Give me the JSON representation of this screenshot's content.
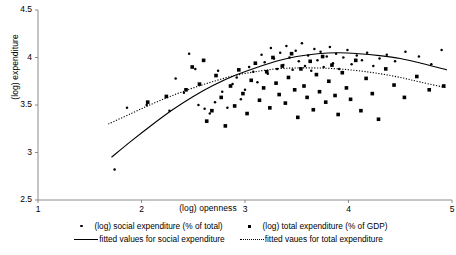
{
  "chart_data": {
    "type": "scatter",
    "title": "",
    "xlabel": "(log) openness",
    "ylabel": "(log) expenditure",
    "xlim": [
      1,
      5
    ],
    "ylim": [
      2.5,
      4.5
    ],
    "xticks": [
      1,
      2,
      3,
      4,
      5
    ],
    "yticks": [
      2.5,
      3.0,
      3.5,
      4.0,
      4.5
    ],
    "xtick_labels": [
      "1",
      "2",
      "3",
      "4",
      "5"
    ],
    "ytick_labels": [
      "2.5",
      "3",
      "3.5",
      "4",
      "4.5"
    ],
    "grid": false,
    "legend_position": "below",
    "series": [
      {
        "name": "(log) social expenditure (% of total)",
        "marker": "dot",
        "points": [
          [
            1.74,
            2.82
          ],
          [
            1.86,
            3.47
          ],
          [
            2.05,
            3.5
          ],
          [
            2.27,
            3.44
          ],
          [
            2.33,
            3.78
          ],
          [
            2.41,
            3.63
          ],
          [
            2.46,
            4.04
          ],
          [
            2.52,
            3.88
          ],
          [
            2.55,
            3.5
          ],
          [
            2.61,
            3.46
          ],
          [
            2.66,
            3.41
          ],
          [
            2.71,
            3.53
          ],
          [
            2.74,
            3.86
          ],
          [
            2.78,
            3.64
          ],
          [
            2.83,
            3.47
          ],
          [
            2.88,
            3.72
          ],
          [
            2.92,
            3.79
          ],
          [
            2.96,
            3.56
          ],
          [
            3.0,
            3.66
          ],
          [
            3.04,
            3.9
          ],
          [
            3.08,
            3.85
          ],
          [
            3.12,
            3.74
          ],
          [
            3.16,
            4.03
          ],
          [
            3.19,
            3.95
          ],
          [
            3.22,
            3.83
          ],
          [
            3.25,
            4.1
          ],
          [
            3.28,
            3.99
          ],
          [
            3.31,
            3.88
          ],
          [
            3.34,
            4.05
          ],
          [
            3.37,
            3.92
          ],
          [
            3.4,
            4.12
          ],
          [
            3.43,
            4.0
          ],
          [
            3.46,
            3.87
          ],
          [
            3.49,
            4.07
          ],
          [
            3.52,
            3.96
          ],
          [
            3.55,
            4.15
          ],
          [
            3.58,
            3.91
          ],
          [
            3.61,
            4.02
          ],
          [
            3.64,
            3.86
          ],
          [
            3.67,
            4.09
          ],
          [
            3.7,
            3.97
          ],
          [
            3.73,
            4.06
          ],
          [
            3.76,
            3.9
          ],
          [
            3.79,
            4.01
          ],
          [
            3.82,
            4.11
          ],
          [
            3.85,
            3.94
          ],
          [
            3.88,
            4.04
          ],
          [
            3.91,
            3.88
          ],
          [
            3.95,
            4.0
          ],
          [
            3.99,
            4.08
          ],
          [
            4.03,
            3.93
          ],
          [
            4.08,
            4.02
          ],
          [
            4.13,
            3.97
          ],
          [
            4.18,
            4.05
          ],
          [
            4.24,
            3.91
          ],
          [
            4.3,
            3.99
          ],
          [
            4.37,
            4.03
          ],
          [
            4.45,
            3.96
          ],
          [
            4.55,
            4.06
          ],
          [
            4.68,
            4.01
          ],
          [
            4.8,
            3.93
          ],
          [
            4.9,
            4.08
          ]
        ]
      },
      {
        "name": "(log) total expenditure (% of GDP)",
        "marker": "square",
        "points": [
          [
            2.06,
            3.53
          ],
          [
            2.24,
            3.59
          ],
          [
            2.43,
            3.66
          ],
          [
            2.49,
            3.9
          ],
          [
            2.56,
            3.72
          ],
          [
            2.6,
            3.97
          ],
          [
            2.63,
            3.33
          ],
          [
            2.68,
            3.44
          ],
          [
            2.72,
            3.81
          ],
          [
            2.77,
            3.58
          ],
          [
            2.81,
            3.28
          ],
          [
            2.86,
            3.7
          ],
          [
            2.9,
            3.49
          ],
          [
            2.94,
            3.87
          ],
          [
            2.98,
            3.62
          ],
          [
            3.02,
            3.41
          ],
          [
            3.06,
            3.76
          ],
          [
            3.1,
            3.94
          ],
          [
            3.14,
            3.55
          ],
          [
            3.18,
            3.68
          ],
          [
            3.21,
            3.85
          ],
          [
            3.24,
            3.47
          ],
          [
            3.27,
            4.0
          ],
          [
            3.3,
            3.73
          ],
          [
            3.33,
            3.61
          ],
          [
            3.36,
            3.91
          ],
          [
            3.39,
            3.52
          ],
          [
            3.42,
            3.79
          ],
          [
            3.45,
            4.04
          ],
          [
            3.48,
            3.66
          ],
          [
            3.51,
            3.37
          ],
          [
            3.54,
            3.88
          ],
          [
            3.57,
            3.7
          ],
          [
            3.6,
            3.58
          ],
          [
            3.63,
            3.96
          ],
          [
            3.66,
            3.45
          ],
          [
            3.69,
            3.82
          ],
          [
            3.72,
            3.64
          ],
          [
            3.75,
            4.01
          ],
          [
            3.78,
            3.53
          ],
          [
            3.81,
            3.75
          ],
          [
            3.84,
            3.92
          ],
          [
            3.87,
            3.6
          ],
          [
            3.9,
            3.4
          ],
          [
            3.94,
            3.84
          ],
          [
            3.98,
            3.68
          ],
          [
            4.02,
            3.56
          ],
          [
            4.07,
            3.97
          ],
          [
            4.12,
            3.44
          ],
          [
            4.17,
            3.78
          ],
          [
            4.23,
            3.62
          ],
          [
            4.29,
            3.35
          ],
          [
            4.36,
            3.88
          ],
          [
            4.44,
            3.71
          ],
          [
            4.54,
            3.58
          ],
          [
            4.66,
            3.8
          ],
          [
            4.78,
            3.66
          ],
          [
            4.92,
            3.7
          ]
        ]
      }
    ],
    "fits": [
      {
        "name": "fitted values for social expenditure",
        "style": "solid",
        "curve": [
          [
            1.71,
            2.95
          ],
          [
            1.9,
            3.12
          ],
          [
            2.1,
            3.29
          ],
          [
            2.3,
            3.45
          ],
          [
            2.5,
            3.59
          ],
          [
            2.7,
            3.71
          ],
          [
            2.9,
            3.81
          ],
          [
            3.1,
            3.89
          ],
          [
            3.3,
            3.96
          ],
          [
            3.5,
            4.01
          ],
          [
            3.7,
            4.04
          ],
          [
            3.9,
            4.05
          ],
          [
            4.1,
            4.04
          ],
          [
            4.3,
            4.02
          ],
          [
            4.5,
            3.99
          ],
          [
            4.7,
            3.94
          ],
          [
            4.95,
            3.87
          ]
        ]
      },
      {
        "name": "fitted vaues for total expenditure",
        "style": "dotted",
        "curve": [
          [
            1.68,
            3.3
          ],
          [
            1.9,
            3.41
          ],
          [
            2.1,
            3.51
          ],
          [
            2.3,
            3.6
          ],
          [
            2.5,
            3.68
          ],
          [
            2.7,
            3.75
          ],
          [
            2.9,
            3.81
          ],
          [
            3.1,
            3.85
          ],
          [
            3.3,
            3.88
          ],
          [
            3.5,
            3.89
          ],
          [
            3.7,
            3.89
          ],
          [
            3.9,
            3.88
          ],
          [
            4.1,
            3.86
          ],
          [
            4.3,
            3.83
          ],
          [
            4.5,
            3.79
          ],
          [
            4.7,
            3.74
          ],
          [
            4.95,
            3.68
          ]
        ]
      }
    ]
  },
  "legend": {
    "entries": [
      {
        "label": "(log) social expenditure (% of total)",
        "marker": "dot"
      },
      {
        "label": "(log) total expenditure (% of GDP)",
        "marker": "square"
      },
      {
        "label": "fitted values for social expenditure",
        "marker": "solid-line"
      },
      {
        "label": "fitted vaues for total expenditure",
        "marker": "dotted-line"
      }
    ]
  },
  "colors": {
    "axis": "#808080",
    "marker": "#000000",
    "line": "#000000",
    "background": "#ffffff"
  }
}
